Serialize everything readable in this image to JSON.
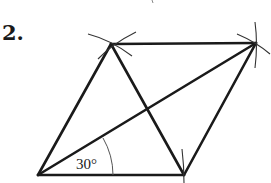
{
  "problem": {
    "number_label": "2."
  },
  "diagram": {
    "type": "rhombus construction",
    "vertices": {
      "A": {
        "x": 38,
        "y": 175
      },
      "B": {
        "x": 184,
        "y": 175
      },
      "C": {
        "x": 256,
        "y": 43
      },
      "D": {
        "x": 111,
        "y": 44
      }
    },
    "angle_label": "30°",
    "colors": {
      "stroke": "#1a1a1a",
      "background": "#ffffff"
    }
  }
}
